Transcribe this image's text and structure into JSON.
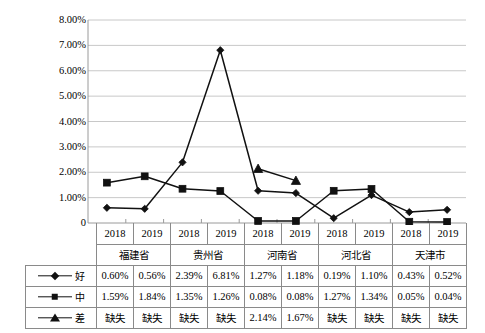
{
  "chart_data": {
    "type": "line",
    "title": "",
    "xlabel": "",
    "ylabel": "",
    "ylim": [
      0,
      0.08
    ],
    "grid": true,
    "legend_position": "table-left-column",
    "ytick_labels": [
      "8.00%",
      "7.00%",
      "6.00%",
      "5.00%",
      "4.00%",
      "3.00%",
      "2.00%",
      "1.00%",
      "0"
    ],
    "ytick_values": [
      0.08,
      0.07,
      0.06,
      0.05,
      0.04,
      0.03,
      0.02,
      0.01,
      0
    ],
    "categories": [
      "2018",
      "2019",
      "2018",
      "2019",
      "2018",
      "2019",
      "2018",
      "2019",
      "2018",
      "2019"
    ],
    "groups": [
      {
        "name": "福建省",
        "years": [
          "2018",
          "2019"
        ]
      },
      {
        "name": "贵州省",
        "years": [
          "2018",
          "2019"
        ]
      },
      {
        "name": "河南省",
        "years": [
          "2018",
          "2019"
        ]
      },
      {
        "name": "河北省",
        "years": [
          "2018",
          "2019"
        ]
      },
      {
        "name": "天津市",
        "years": [
          "2018",
          "2019"
        ]
      }
    ],
    "series": [
      {
        "name": "好",
        "marker": "diamond",
        "values": [
          0.006,
          0.0056,
          0.0239,
          0.0681,
          0.0127,
          0.0118,
          0.0019,
          0.011,
          0.0043,
          0.0052
        ],
        "labels": [
          "0.60%",
          "0.56%",
          "2.39%",
          "6.81%",
          "1.27%",
          "1.18%",
          "0.19%",
          "1.10%",
          "0.43%",
          "0.52%"
        ]
      },
      {
        "name": "中",
        "marker": "square",
        "values": [
          0.0159,
          0.0184,
          0.0135,
          0.0126,
          0.0008,
          0.0008,
          0.0127,
          0.0134,
          0.0005,
          0.0004
        ],
        "labels": [
          "1.59%",
          "1.84%",
          "1.35%",
          "1.26%",
          "0.08%",
          "0.08%",
          "1.27%",
          "1.34%",
          "0.05%",
          "0.04%"
        ]
      },
      {
        "name": "差",
        "marker": "triangle",
        "values": [
          null,
          null,
          null,
          null,
          0.0214,
          0.0167,
          null,
          null,
          null,
          null
        ],
        "labels": [
          "缺失",
          "缺失",
          "缺失",
          "缺失",
          "2.14%",
          "1.67%",
          "缺失",
          "缺失",
          "缺失",
          "缺失"
        ]
      }
    ]
  },
  "table": {
    "year_row": [
      "2018",
      "2019",
      "2018",
      "2019",
      "2018",
      "2019",
      "2018",
      "2019",
      "2018",
      "2019"
    ],
    "province_row": [
      "福建省",
      "贵州省",
      "河南省",
      "河北省",
      "天津市"
    ],
    "rows": [
      {
        "label": "好",
        "marker": "diamond",
        "cells": [
          "0.60%",
          "0.56%",
          "2.39%",
          "6.81%",
          "1.27%",
          "1.18%",
          "0.19%",
          "1.10%",
          "0.43%",
          "0.52%"
        ]
      },
      {
        "label": "中",
        "marker": "square",
        "cells": [
          "1.59%",
          "1.84%",
          "1.35%",
          "1.26%",
          "0.08%",
          "0.08%",
          "1.27%",
          "1.34%",
          "0.05%",
          "0.04%"
        ]
      },
      {
        "label": "差",
        "marker": "triangle",
        "cells": [
          "缺失",
          "缺失",
          "缺失",
          "缺失",
          "2.14%",
          "1.67%",
          "缺失",
          "缺失",
          "缺失",
          "缺失"
        ]
      }
    ]
  },
  "colors": {
    "line": "#111111",
    "grid": "#c8c8c8",
    "axis": "#9a9a9a",
    "table_border": "#8a8a8a",
    "background": "#ffffff"
  }
}
